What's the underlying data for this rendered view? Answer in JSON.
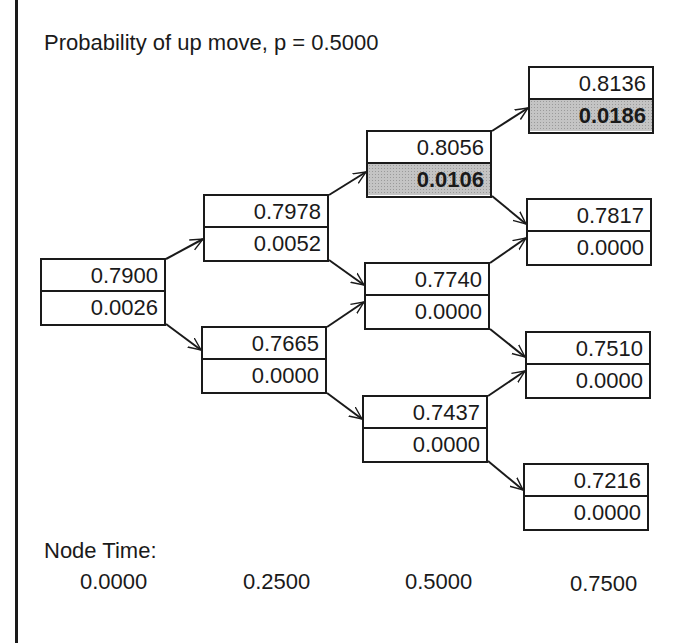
{
  "title": "Probability of up move, p = 0.5000",
  "nodes": [
    {
      "id": "n0",
      "step": 0,
      "value": "0.7900",
      "sub": "0.0026",
      "highlight": false
    },
    {
      "id": "n1u",
      "step": 1,
      "value": "0.7978",
      "sub": "0.0052",
      "highlight": false
    },
    {
      "id": "n1d",
      "step": 1,
      "value": "0.7665",
      "sub": "0.0000",
      "highlight": false
    },
    {
      "id": "n2uu",
      "step": 2,
      "value": "0.8056",
      "sub": "0.0106",
      "highlight": true
    },
    {
      "id": "n2ud",
      "step": 2,
      "value": "0.7740",
      "sub": "0.0000",
      "highlight": false
    },
    {
      "id": "n2dd",
      "step": 2,
      "value": "0.7437",
      "sub": "0.0000",
      "highlight": false
    },
    {
      "id": "n3a",
      "step": 3,
      "value": "0.8136",
      "sub": "0.0186",
      "highlight": true
    },
    {
      "id": "n3b",
      "step": 3,
      "value": "0.7817",
      "sub": "0.0000",
      "highlight": false
    },
    {
      "id": "n3c",
      "step": 3,
      "value": "0.7510",
      "sub": "0.0000",
      "highlight": false
    },
    {
      "id": "n3d",
      "step": 3,
      "value": "0.7216",
      "sub": "0.0000",
      "highlight": false
    }
  ],
  "node_time": {
    "label": "Node Time:",
    "values": [
      "0.0000",
      "0.2500",
      "0.5000",
      "0.7500"
    ]
  },
  "colors": {
    "line": "#1a1a1a",
    "highlight_fill": "#c4c4c4",
    "background": "#ffffff"
  }
}
